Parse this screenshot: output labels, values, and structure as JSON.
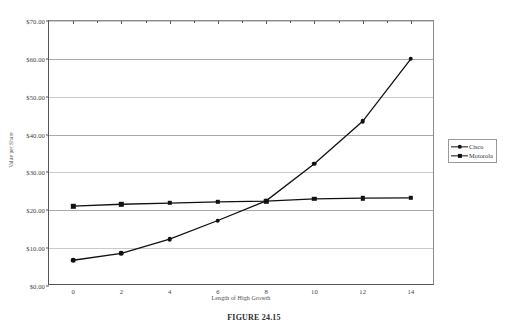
{
  "chart_data": {
    "type": "line",
    "title": "",
    "xlabel": "Length of High Growth",
    "ylabel": "Value per Share",
    "x": [
      0,
      2,
      4,
      6,
      8,
      10,
      12,
      14
    ],
    "xlim": [
      -1,
      15
    ],
    "ylim": [
      0,
      70
    ],
    "xticks": [
      "0",
      "2",
      "4",
      "6",
      "8",
      "10",
      "12",
      "14"
    ],
    "yticks": [
      "$0.00",
      "$10.00",
      "$20.00",
      "$30.00",
      "$40.00",
      "$50.00",
      "$60.00",
      "$70.00"
    ],
    "ytick_values": [
      0,
      10,
      20,
      30,
      40,
      50,
      60,
      70
    ],
    "grid": true,
    "legend_position": "right",
    "series": [
      {
        "name": "Cisco",
        "marker": "circle",
        "color": "#111111",
        "values": [
          6.8,
          8.6,
          12.4,
          17.3,
          22.5,
          32.3,
          43.5,
          60.0
        ]
      },
      {
        "name": "Motorola",
        "marker": "square",
        "color": "#111111",
        "values": [
          21.1,
          21.6,
          21.9,
          22.2,
          22.4,
          23.0,
          23.2,
          23.3
        ]
      }
    ]
  },
  "legend": {
    "items": [
      {
        "label": "Cisco",
        "marker": "circle"
      },
      {
        "label": "Motorola",
        "marker": "square"
      }
    ]
  },
  "caption": {
    "text": "FIGURE 24.15"
  }
}
